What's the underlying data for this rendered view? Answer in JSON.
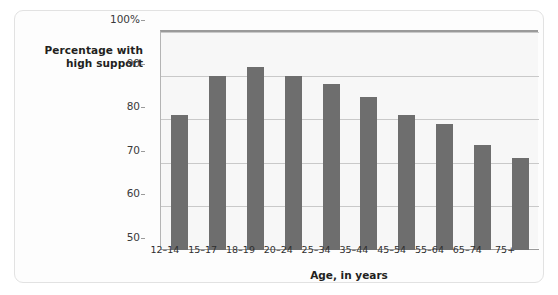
{
  "chart_data": {
    "type": "bar",
    "title": "",
    "subtitle": "",
    "xlabel": "Age, in years",
    "ylabel": "Percentage with high support",
    "ylabel_lines": [
      "Percentage with",
      "high support"
    ],
    "categories": [
      "12–14",
      "15–17",
      "18–19",
      "20–24",
      "25–34",
      "35–44",
      "45–54",
      "55–64",
      "65–74",
      "75+"
    ],
    "values": [
      81,
      90,
      92,
      90,
      88,
      85,
      81,
      79,
      74,
      71
    ],
    "ylim": [
      50,
      100
    ],
    "yticks": [
      50,
      60,
      70,
      80,
      90,
      100
    ],
    "ytick_labels": [
      "50",
      "60",
      "70",
      "80",
      "90",
      "100%"
    ],
    "grid": true,
    "legend": "none",
    "bar_color": "#6e6e6e",
    "plot_background": "#f7f7f7",
    "gridline_color": "#c9c9c9",
    "axis_color": "#9a9a9a",
    "panel_background": "#fdfdfd",
    "page_background": "#ffffff"
  }
}
